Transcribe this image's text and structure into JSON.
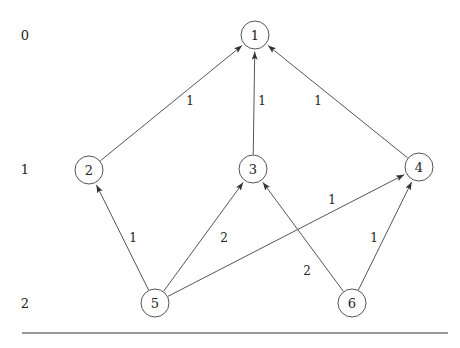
{
  "diagram": {
    "background_color": "#ffffff",
    "stroke_color": "#555555",
    "text_color": "#222222",
    "rule_color": "#999999"
  },
  "level_labels": [
    {
      "text": "0",
      "x": 25,
      "y": 35
    },
    {
      "text": "1",
      "x": 25,
      "y": 169
    },
    {
      "text": "2",
      "x": 25,
      "y": 303
    }
  ],
  "nodes": [
    {
      "id": "1",
      "label": "1",
      "cx": 255,
      "cy": 35,
      "r": 14,
      "level": 0
    },
    {
      "id": "2",
      "label": "2",
      "cx": 89,
      "cy": 170,
      "r": 14,
      "level": 1
    },
    {
      "id": "3",
      "label": "3",
      "cx": 253,
      "cy": 169,
      "r": 14,
      "level": 1
    },
    {
      "id": "4",
      "label": "4",
      "cx": 419,
      "cy": 167,
      "r": 14,
      "level": 1
    },
    {
      "id": "5",
      "label": "5",
      "cx": 155,
      "cy": 303,
      "r": 14,
      "level": 2
    },
    {
      "id": "6",
      "label": "6",
      "cx": 352,
      "cy": 303,
      "r": 14,
      "level": 2
    }
  ],
  "edges": [
    {
      "id": "e-2-1",
      "from": "2",
      "to": "1",
      "weight": "1",
      "label_x": 190,
      "label_y": 101,
      "directed": true
    },
    {
      "id": "e-3-1",
      "from": "3",
      "to": "1",
      "weight": "1",
      "label_x": 262,
      "label_y": 101,
      "directed": true
    },
    {
      "id": "e-4-1",
      "from": "4",
      "to": "1",
      "weight": "1",
      "label_x": 318,
      "label_y": 101,
      "directed": true
    },
    {
      "id": "e-5-2",
      "from": "5",
      "to": "2",
      "weight": "1",
      "label_x": 133,
      "label_y": 238,
      "directed": true
    },
    {
      "id": "e-5-3",
      "from": "5",
      "to": "3",
      "weight": "2",
      "label_x": 224,
      "label_y": 238,
      "directed": true
    },
    {
      "id": "e-5-4",
      "from": "5",
      "to": "4",
      "weight": "1",
      "label_x": 332,
      "label_y": 200,
      "directed": true
    },
    {
      "id": "e-6-3",
      "from": "6",
      "to": "3",
      "weight": "2",
      "label_x": 307,
      "label_y": 271,
      "directed": true
    },
    {
      "id": "e-6-4",
      "from": "6",
      "to": "4",
      "weight": "1",
      "label_x": 374,
      "label_y": 238,
      "directed": true
    }
  ],
  "baseline_rule": {
    "x1": 22,
    "y1": 333,
    "x2": 448,
    "y2": 333
  }
}
